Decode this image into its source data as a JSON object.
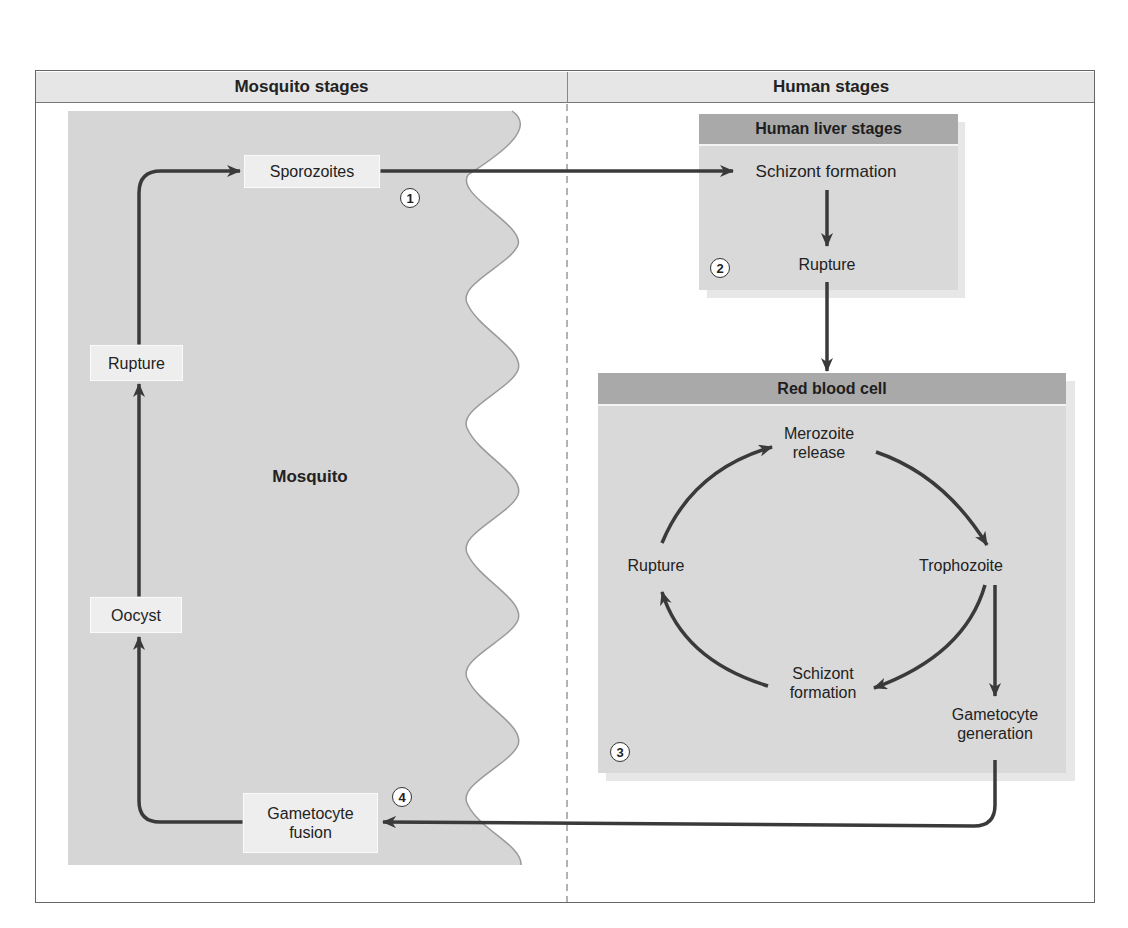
{
  "columns": {
    "left_title": "Mosquito stages",
    "right_title": "Human stages"
  },
  "mosquito": {
    "region_label": "Mosquito",
    "stages": {
      "sporozoites": "Sporozoites",
      "rupture": "Rupture",
      "oocyst": "Oocyst",
      "gametocyte_fusion_line1": "Gametocyte",
      "gametocyte_fusion_line2": "fusion"
    }
  },
  "liver": {
    "title": "Human liver stages",
    "schizont_formation": "Schizont formation",
    "rupture": "Rupture"
  },
  "rbc": {
    "title": "Red blood cell",
    "merozoite_line1": "Merozoite",
    "merozoite_line2": "release",
    "trophozoite": "Trophozoite",
    "schizont_line1": "Schizont",
    "schizont_line2": "formation",
    "rupture": "Rupture",
    "gametocyte_line1": "Gametocyte",
    "gametocyte_line2": "generation"
  },
  "badges": [
    "1",
    "2",
    "3",
    "4"
  ],
  "colors": {
    "mosquito_fill": "#d6d6d6",
    "panel_fill": "#d9d9d9",
    "panel_header": "#a9a9a9",
    "arrow": "#3a3a3a",
    "wave_edge": "#9a9a9a"
  }
}
